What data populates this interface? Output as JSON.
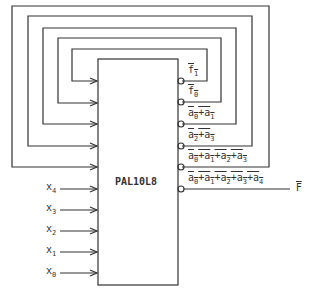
{
  "chip": {
    "label": "PAL10L8"
  },
  "inputs": [
    {
      "name": "x",
      "sub": "4"
    },
    {
      "name": "x",
      "sub": "3"
    },
    {
      "name": "x",
      "sub": "2"
    },
    {
      "name": "x",
      "sub": "1"
    },
    {
      "name": "x",
      "sub": "0"
    }
  ],
  "outputs": [
    {
      "terms": [
        [
          "f",
          "1"
        ]
      ],
      "sep": ""
    },
    {
      "terms": [
        [
          "f",
          "0"
        ]
      ],
      "sep": ""
    },
    {
      "terms": [
        [
          "a",
          "0"
        ],
        [
          "a",
          "1"
        ]
      ],
      "sep": "+"
    },
    {
      "terms": [
        [
          "a",
          "2"
        ],
        [
          "a",
          "3"
        ]
      ],
      "sep": "+"
    },
    {
      "terms": [
        [
          "a",
          "0"
        ],
        [
          "a",
          "1"
        ],
        [
          "a",
          "2"
        ],
        [
          "a",
          "3"
        ]
      ],
      "sep": "+"
    },
    {
      "terms": [
        [
          "a",
          "0"
        ],
        [
          "a",
          "1"
        ],
        [
          "a",
          "2"
        ],
        [
          "a",
          "3"
        ],
        [
          "a",
          "4"
        ]
      ],
      "sep": "+"
    }
  ],
  "final_output": {
    "label": "F",
    "inverted": true
  }
}
